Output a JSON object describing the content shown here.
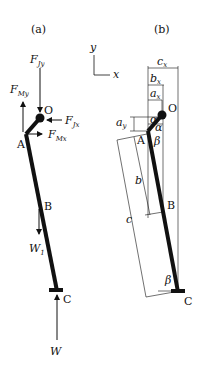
{
  "panels": {
    "a": {
      "label": "(a)",
      "points": {
        "O": "O",
        "A": "A",
        "B": "B",
        "C": "C"
      },
      "forces": {
        "FJy": {
          "main": "F",
          "sub": "Jy"
        },
        "FJx": {
          "main": "F",
          "sub": "Jx"
        },
        "FMy": {
          "main": "F",
          "sub": "My"
        },
        "FMx": {
          "main": "F",
          "sub": "Mx"
        },
        "W1": {
          "main": "W",
          "sub": "1"
        },
        "W": {
          "main": "W",
          "sub": ""
        }
      }
    },
    "b": {
      "label": "(b)",
      "points": {
        "O": "O",
        "A": "A",
        "B": "B",
        "C": "C"
      },
      "dimensions": {
        "cx": {
          "main": "c",
          "sub": "x"
        },
        "bx": {
          "main": "b",
          "sub": "x"
        },
        "ax": {
          "main": "a",
          "sub": "x"
        },
        "ay": {
          "main": "a",
          "sub": "y"
        },
        "b": "b",
        "c": "c"
      },
      "angles": {
        "alpha": "α",
        "beta": "β"
      }
    }
  },
  "axes": {
    "y": "y",
    "x": "x"
  },
  "colors": {
    "ink": "#111111",
    "background": "#ffffff"
  }
}
